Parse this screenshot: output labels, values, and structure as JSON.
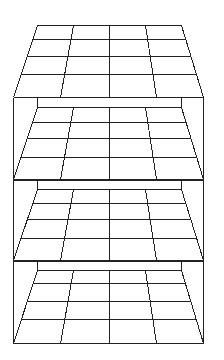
{
  "diagram": {
    "title": "",
    "colors": {
      "line": "#222222",
      "background": "#ffffff"
    },
    "grid": {
      "columns": 4,
      "rows": 4
    },
    "floor_shape": {
      "top_left_x": 37,
      "top_right_x": 181,
      "bottom_left_x": 13,
      "bottom_right_x": 203,
      "top_col_x": [
        73,
        109,
        145
      ],
      "bottom_col_x": [
        60,
        109,
        156
      ]
    },
    "layers": [
      {
        "name": "layer-1",
        "box_top": null,
        "top": 25,
        "rows": [
          39,
          56,
          74
        ],
        "bottom": 97
      },
      {
        "name": "layer-2",
        "box_top": 97,
        "top": 107,
        "rows": [
          122,
          138,
          157
        ],
        "bottom": 179
      },
      {
        "name": "layer-3",
        "box_top": 180,
        "top": 189,
        "rows": [
          203,
          219,
          238
        ],
        "bottom": 260
      },
      {
        "name": "layer-4",
        "box_top": 261,
        "top": 270,
        "rows": [
          283,
          301,
          319
        ],
        "bottom": 343
      }
    ],
    "frame": {
      "left_x": 13,
      "right_x": 203,
      "top_y": 97,
      "bottom_y": 343
    }
  }
}
